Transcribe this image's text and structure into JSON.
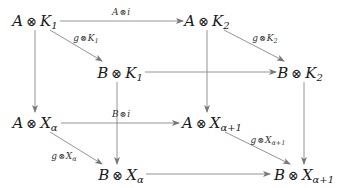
{
  "diagram": {
    "type": "commutative-cube",
    "colors": {
      "arrow": "#777777",
      "text": "#1a1a1a",
      "background": "#ffffff"
    },
    "nodes": {
      "AK1": {
        "left": "A",
        "op": "⊗",
        "right": "K",
        "sub": "1"
      },
      "AK2": {
        "left": "A",
        "op": "⊗",
        "right": "K",
        "sub": "2"
      },
      "BK1": {
        "left": "B",
        "op": "⊗",
        "right": "K",
        "sub": "1"
      },
      "BK2": {
        "left": "B",
        "op": "⊗",
        "right": "K",
        "sub": "2"
      },
      "AXa": {
        "left": "A",
        "op": "⊗",
        "right": "X",
        "sub": "α"
      },
      "AXa1": {
        "left": "A",
        "op": "⊗",
        "right": "X",
        "sub": "α+1"
      },
      "BXa": {
        "left": "B",
        "op": "⊗",
        "right": "X",
        "sub": "α"
      },
      "BXa1": {
        "left": "B",
        "op": "⊗",
        "right": "X",
        "sub": "α+1"
      }
    },
    "labels": {
      "Ai": {
        "left": "A",
        "op": "⊗",
        "right": "i",
        "sub": ""
      },
      "gK1": {
        "left": "g",
        "op": "⊗",
        "right": "K",
        "sub": "1"
      },
      "gK2": {
        "left": "g",
        "op": "⊗",
        "right": "K",
        "sub": "2"
      },
      "Bi": {
        "left": "B",
        "op": "⊗",
        "right": "i",
        "sub": ""
      },
      "gXa": {
        "left": "g",
        "op": "⊗",
        "right": "X",
        "sub": "α"
      },
      "gXa1": {
        "left": "g",
        "op": "⊗",
        "right": "X",
        "sub": "α+1"
      }
    },
    "edges": [
      {
        "from": "A⊗K1",
        "to": "A⊗K2",
        "label": "A⊗i"
      },
      {
        "from": "A⊗K1",
        "to": "B⊗K1",
        "label": "g⊗K1"
      },
      {
        "from": "A⊗K2",
        "to": "B⊗K2",
        "label": "g⊗K2"
      },
      {
        "from": "B⊗K1",
        "to": "B⊗K2",
        "label": ""
      },
      {
        "from": "A⊗K1",
        "to": "A⊗Xα",
        "label": ""
      },
      {
        "from": "A⊗K2",
        "to": "A⊗Xα+1",
        "label": ""
      },
      {
        "from": "B⊗K1",
        "to": "B⊗Xα",
        "label": ""
      },
      {
        "from": "B⊗K2",
        "to": "B⊗Xα+1",
        "label": ""
      },
      {
        "from": "A⊗Xα",
        "to": "A⊗Xα+1",
        "label": "B⊗i"
      },
      {
        "from": "A⊗Xα",
        "to": "B⊗Xα",
        "label": "g⊗Xα"
      },
      {
        "from": "A⊗Xα+1",
        "to": "B⊗Xα+1",
        "label": "g⊗Xα+1"
      },
      {
        "from": "B⊗Xα",
        "to": "B⊗Xα+1",
        "label": ""
      }
    ]
  }
}
